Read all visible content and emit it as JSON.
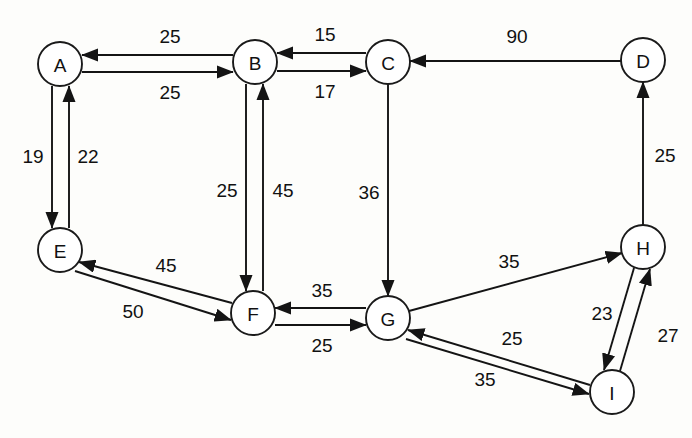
{
  "diagram": {
    "type": "directed-weighted-graph",
    "background_color": "#fdfdfb",
    "stroke_color": "#141414",
    "node_fill": "#ffffff",
    "node_radius": 22,
    "nodes": [
      {
        "id": "A",
        "label": "A",
        "cx": 60,
        "cy": 64
      },
      {
        "id": "B",
        "label": "B",
        "cx": 255,
        "cy": 62
      },
      {
        "id": "C",
        "label": "C",
        "cx": 388,
        "cy": 62
      },
      {
        "id": "D",
        "label": "D",
        "cx": 643,
        "cy": 60
      },
      {
        "id": "E",
        "label": "E",
        "cx": 60,
        "cy": 250
      },
      {
        "id": "F",
        "label": "F",
        "cx": 253,
        "cy": 313
      },
      {
        "id": "G",
        "label": "G",
        "cx": 388,
        "cy": 318
      },
      {
        "id": "H",
        "label": "H",
        "cx": 643,
        "cy": 247
      },
      {
        "id": "I",
        "label": "I",
        "cx": 612,
        "cy": 392
      }
    ],
    "edges": [
      {
        "id": "e-B-A",
        "from": "B",
        "to": "A",
        "weight": "25",
        "x1": 233,
        "y1": 55,
        "x2": 82,
        "y2": 55,
        "lx": 170,
        "ly": 36
      },
      {
        "id": "e-A-B",
        "from": "A",
        "to": "B",
        "weight": "25",
        "x1": 82,
        "y1": 72,
        "x2": 233,
        "y2": 72,
        "lx": 170,
        "ly": 92
      },
      {
        "id": "e-C-B",
        "from": "C",
        "to": "B",
        "weight": "15",
        "x1": 366,
        "y1": 53,
        "x2": 277,
        "y2": 53,
        "lx": 325,
        "ly": 34
      },
      {
        "id": "e-B-C",
        "from": "B",
        "to": "C",
        "weight": "17",
        "x1": 277,
        "y1": 71,
        "x2": 366,
        "y2": 71,
        "lx": 325,
        "ly": 91
      },
      {
        "id": "e-D-C",
        "from": "D",
        "to": "C",
        "weight": "90",
        "x1": 621,
        "y1": 61,
        "x2": 410,
        "y2": 61,
        "lx": 517,
        "ly": 36
      },
      {
        "id": "e-A-E",
        "from": "A",
        "to": "E",
        "weight": "19",
        "x1": 52,
        "y1": 86,
        "x2": 52,
        "y2": 228,
        "lx": 33,
        "ly": 156
      },
      {
        "id": "e-E-A",
        "from": "E",
        "to": "A",
        "weight": "22",
        "x1": 69,
        "y1": 228,
        "x2": 69,
        "y2": 86,
        "lx": 88,
        "ly": 156
      },
      {
        "id": "e-B-F",
        "from": "B",
        "to": "F",
        "weight": "25",
        "x1": 246,
        "y1": 84,
        "x2": 246,
        "y2": 291,
        "lx": 227,
        "ly": 190
      },
      {
        "id": "e-F-B",
        "from": "F",
        "to": "B",
        "weight": "45",
        "x1": 263,
        "y1": 291,
        "x2": 263,
        "y2": 84,
        "lx": 283,
        "ly": 190
      },
      {
        "id": "e-C-G",
        "from": "C",
        "to": "G",
        "weight": "36",
        "x1": 388,
        "y1": 84,
        "x2": 388,
        "y2": 296,
        "lx": 369,
        "ly": 192
      },
      {
        "id": "e-H-D",
        "from": "H",
        "to": "D",
        "weight": "25",
        "x1": 643,
        "y1": 225,
        "x2": 643,
        "y2": 82,
        "lx": 665,
        "ly": 155
      },
      {
        "id": "e-F-E",
        "from": "F",
        "to": "E",
        "weight": "45",
        "x1": 232,
        "y1": 303,
        "x2": 79,
        "y2": 262,
        "lx": 166,
        "ly": 265
      },
      {
        "id": "e-E-F",
        "from": "E",
        "to": "F",
        "weight": "50",
        "x1": 75,
        "y1": 271,
        "x2": 231,
        "y2": 320,
        "lx": 133,
        "ly": 311
      },
      {
        "id": "e-G-F",
        "from": "G",
        "to": "F",
        "weight": "35",
        "x1": 366,
        "y1": 308,
        "x2": 275,
        "y2": 308,
        "lx": 322,
        "ly": 290
      },
      {
        "id": "e-F-G",
        "from": "F",
        "to": "G",
        "weight": "25",
        "x1": 275,
        "y1": 325,
        "x2": 366,
        "y2": 325,
        "lx": 322,
        "ly": 345
      },
      {
        "id": "e-G-H",
        "from": "G",
        "to": "H",
        "weight": "35",
        "x1": 409,
        "y1": 311,
        "x2": 622,
        "y2": 253,
        "lx": 509,
        "ly": 261
      },
      {
        "id": "e-H-I",
        "from": "H",
        "to": "I",
        "weight": "23",
        "x1": 634,
        "y1": 268,
        "x2": 604,
        "y2": 370,
        "lx": 602,
        "ly": 313
      },
      {
        "id": "e-I-H",
        "from": "I",
        "to": "H",
        "weight": "27",
        "x1": 620,
        "y1": 371,
        "x2": 650,
        "y2": 269,
        "lx": 668,
        "ly": 335
      },
      {
        "id": "e-I-G",
        "from": "I",
        "to": "G",
        "weight": "25",
        "x1": 590,
        "y1": 385,
        "x2": 408,
        "y2": 330,
        "lx": 512,
        "ly": 338
      },
      {
        "id": "e-G-I",
        "from": "G",
        "to": "I",
        "weight": "35",
        "x1": 406,
        "y1": 339,
        "x2": 589,
        "y2": 394,
        "lx": 485,
        "ly": 379
      }
    ]
  }
}
